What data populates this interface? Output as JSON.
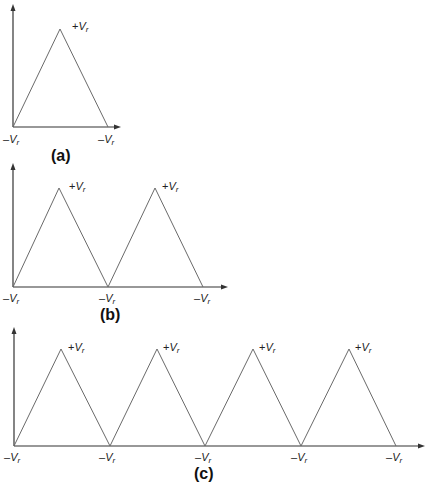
{
  "figures": [
    {
      "id": "a",
      "caption": "(a)",
      "peak_label": {
        "sign": "+",
        "symbol": "V",
        "subscript": "r"
      },
      "valley_label": {
        "sign": "–",
        "symbol": "V",
        "subscript": "r"
      },
      "cycles": 1
    },
    {
      "id": "b",
      "caption": "(b)",
      "peak_label": {
        "sign": "+",
        "symbol": "V",
        "subscript": "r"
      },
      "valley_label": {
        "sign": "–",
        "symbol": "V",
        "subscript": "r"
      },
      "cycles": 2
    },
    {
      "id": "c",
      "caption": "(c)",
      "peak_label": {
        "sign": "+",
        "symbol": "V",
        "subscript": "r"
      },
      "valley_label": {
        "sign": "–",
        "symbol": "V",
        "subscript": "r"
      },
      "cycles": 4
    }
  ],
  "colors": {
    "waveform": "#6a6a6a",
    "axis": "#333333",
    "text": "#222222",
    "background": "#ffffff"
  }
}
